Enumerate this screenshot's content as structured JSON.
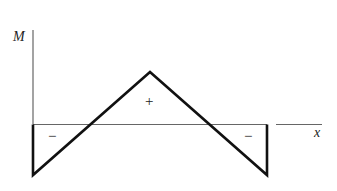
{
  "diagram": {
    "axes": {
      "y_label": "M",
      "x_label": "x"
    },
    "regions": [
      {
        "sign": "−",
        "position": "left"
      },
      {
        "sign": "+",
        "position": "center"
      },
      {
        "sign": "−",
        "position": "right"
      }
    ],
    "colors": {
      "curve": "#111111",
      "axis": "#555555",
      "background": "#ffffff"
    }
  }
}
